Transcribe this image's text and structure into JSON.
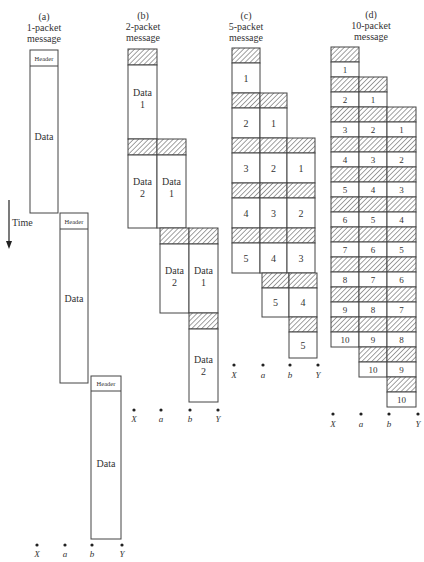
{
  "panels": [
    {
      "id": "a",
      "letter": "(a)",
      "title_line1": "1-packet",
      "title_line2": "message",
      "header_label": "Header",
      "data_label": "Data"
    },
    {
      "id": "b",
      "letter": "(b)",
      "title_line1": "2-packet",
      "title_line2": "message",
      "data_labels": [
        "Data",
        "1",
        "Data",
        "2"
      ]
    },
    {
      "id": "c",
      "letter": "(c)",
      "title_line1": "5-packet",
      "title_line2": "message",
      "packets": [
        "1",
        "2",
        "3",
        "4",
        "5"
      ]
    },
    {
      "id": "d",
      "letter": "(d)",
      "title_line1": "10-packet",
      "title_line2": "message",
      "packets": [
        "1",
        "2",
        "3",
        "4",
        "5",
        "6",
        "7",
        "8",
        "9",
        "10"
      ]
    }
  ],
  "axis": {
    "time_label": "Time"
  },
  "nodes": [
    "X",
    "a",
    "b",
    "Y"
  ],
  "colors": {
    "stroke": "#444444",
    "hatch": "#555555",
    "background": "#ffffff"
  }
}
